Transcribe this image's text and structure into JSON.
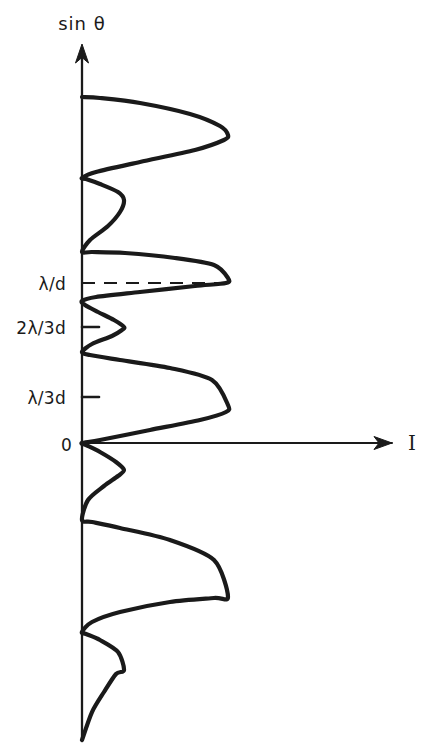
{
  "figure": {
    "kind": "hand-drawn-plot",
    "background_color": "#ffffff",
    "ink_color": "#1a1a1a"
  },
  "axes": {
    "vertical": {
      "name": "sin theta axis",
      "label": "sin θ",
      "x_px": 82,
      "arrow": "up"
    },
    "horizontal": {
      "name": "intensity axis",
      "label": "I",
      "y_px": 443,
      "arrow": "right"
    }
  },
  "ticks": [
    {
      "label": "λ/d",
      "y_px": 283,
      "marker": "dashed-guide"
    },
    {
      "label": "2λ/3d",
      "y_px": 327,
      "marker": "tick"
    },
    {
      "label": "λ/3d",
      "y_px": 397,
      "marker": "tick"
    },
    {
      "label": "0",
      "y_px": 443,
      "marker": "axis"
    }
  ],
  "guide_line": {
    "name": "lambda-over-d-guide",
    "label": "λ/d",
    "style": "dashed",
    "from_x": 82,
    "to_x": 228,
    "y_px": 283
  },
  "chart_data": {
    "type": "line",
    "title": "",
    "xlabel": "I",
    "ylabel": "sin θ",
    "orientation": "horizontal-intensity",
    "grid": false,
    "legend": false,
    "xlim": [
      0,
      1
    ],
    "ylim_labels": [
      "0",
      "λ/3d",
      "2λ/3d",
      "λ/d"
    ],
    "principal_maximum_intensity": 1.0,
    "secondary_maximum_intensity": 0.29,
    "features": [
      {
        "type": "principal-maximum",
        "y_px": 597,
        "intensity": 1.0,
        "peak_x_px": 228
      },
      {
        "type": "secondary-maximum",
        "y_px": 670,
        "intensity": 0.29,
        "peak_x_px": 124
      },
      {
        "type": "principal-maximum",
        "y_px": 443,
        "intensity": 1.0,
        "peak_x_px": 228
      },
      {
        "type": "secondary-maximum",
        "y_px": 352,
        "intensity": 0.29,
        "peak_x_px": 124
      },
      {
        "type": "principal-maximum",
        "y_px": 283,
        "intensity": 1.0,
        "peak_x_px": 228
      },
      {
        "type": "secondary-maximum",
        "y_px": 200,
        "intensity": 0.29,
        "peak_x_px": 124
      },
      {
        "type": "principal-maximum",
        "y_px": 135,
        "intensity": 1.0,
        "peak_x_px": 228
      }
    ],
    "minima_y_px": [
      740,
      632,
      520,
      470,
      397,
      327,
      252,
      178,
      98
    ],
    "series": [
      {
        "name": "intensity",
        "points_px": [
          [
            82,
            740
          ],
          [
            92,
            712
          ],
          [
            104,
            692
          ],
          [
            116,
            674
          ],
          [
            124,
            670
          ],
          [
            118,
            652
          ],
          [
            100,
            640
          ],
          [
            86,
            634
          ],
          [
            82,
            632
          ],
          [
            92,
            622
          ],
          [
            120,
            612
          ],
          [
            170,
            602
          ],
          [
            214,
            598
          ],
          [
            228,
            597
          ],
          [
            214,
            560
          ],
          [
            170,
            540
          ],
          [
            120,
            528
          ],
          [
            92,
            522
          ],
          [
            82,
            520
          ],
          [
            88,
            500
          ],
          [
            104,
            486
          ],
          [
            118,
            476
          ],
          [
            124,
            470
          ],
          [
            116,
            462
          ],
          [
            100,
            452
          ],
          [
            86,
            445
          ],
          [
            82,
            443
          ],
          [
            100,
            440
          ],
          [
            150,
            430
          ],
          [
            200,
            420
          ],
          [
            226,
            412
          ],
          [
            228,
            405
          ],
          [
            212,
            380
          ],
          [
            170,
            368
          ],
          [
            120,
            360
          ],
          [
            90,
            355
          ],
          [
            82,
            352
          ],
          [
            92,
            344
          ],
          [
            112,
            336
          ],
          [
            122,
            330
          ],
          [
            124,
            327
          ],
          [
            114,
            320
          ],
          [
            98,
            312
          ],
          [
            85,
            305
          ],
          [
            82,
            301
          ],
          [
            96,
            297
          ],
          [
            140,
            292
          ],
          [
            195,
            286
          ],
          [
            226,
            283
          ],
          [
            228,
            278
          ],
          [
            214,
            265
          ],
          [
            175,
            258
          ],
          [
            125,
            253
          ],
          [
            92,
            252
          ],
          [
            82,
            252
          ],
          [
            90,
            240
          ],
          [
            108,
            226
          ],
          [
            120,
            212
          ],
          [
            124,
            200
          ],
          [
            118,
            192
          ],
          [
            100,
            184
          ],
          [
            86,
            179
          ],
          [
            82,
            178
          ],
          [
            96,
            172
          ],
          [
            140,
            162
          ],
          [
            195,
            150
          ],
          [
            224,
            140
          ],
          [
            228,
            135
          ],
          [
            220,
            126
          ],
          [
            190,
            114
          ],
          [
            140,
            103
          ],
          [
            100,
            98
          ],
          [
            82,
            97
          ]
        ]
      }
    ]
  }
}
